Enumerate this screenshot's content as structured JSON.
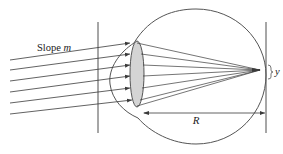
{
  "diagram": {
    "title_fragment": "...",
    "labels": {
      "slope": "Slope ",
      "slope_var": "m",
      "distance": "R",
      "offset": "y"
    },
    "colors": {
      "line": "#3a3a3a",
      "lens_fill": "#d4d4d4",
      "background": "#ffffff"
    },
    "elements": [
      "left-vertical-line",
      "right-vertical-line",
      "eyeball-outline",
      "cornea",
      "lens",
      "incoming-rays",
      "converging-rays",
      "R-dimension-arrow",
      "y-brace"
    ]
  }
}
